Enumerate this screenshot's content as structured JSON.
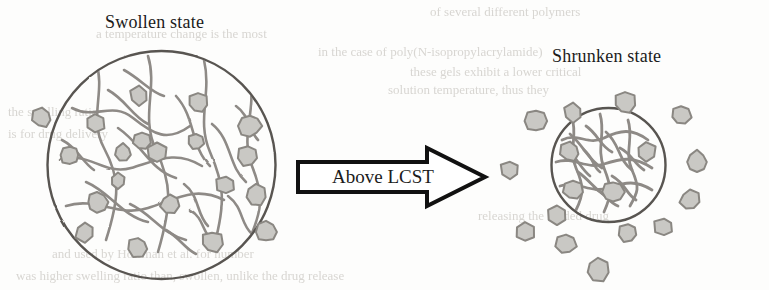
{
  "figure": {
    "title_left": "Swollen state",
    "title_right": "Shrunken state",
    "arrow_label": "Above LCST",
    "colors": {
      "background": "#fdfdfc",
      "circle_outline": "#595551",
      "polymer_strand": "#8e8a86",
      "particle_fill": "#c9c8c4",
      "particle_outline": "#8a8782",
      "text": "#1b1b1b",
      "arrow_outline": "#111111",
      "arrow_fill": "#ffffff",
      "ghost_text": "#d8d6d2"
    },
    "ghost_text_lines": [
      {
        "text": "of several different polymers",
        "x": 430,
        "y": 4,
        "size": 13
      },
      {
        "text": "a temperature change is the most",
        "x": 96,
        "y": 26,
        "size": 13
      },
      {
        "text": "in the case of poly(N-isopropylacrylamide)",
        "x": 318,
        "y": 44,
        "size": 13
      },
      {
        "text": "these gels exhibit a lower critical",
        "x": 410,
        "y": 64,
        "size": 13
      },
      {
        "text": "solution temperature, thus they",
        "x": 388,
        "y": 82,
        "size": 13
      },
      {
        "text": "the swelling ratio",
        "x": 8,
        "y": 104,
        "size": 13
      },
      {
        "text": "is for drug delivery",
        "x": 8,
        "y": 126,
        "size": 13
      },
      {
        "text": "releasing the loaded drug",
        "x": 478,
        "y": 208,
        "size": 13
      },
      {
        "text": "and used by Hoffman et al. for number",
        "x": 52,
        "y": 246,
        "size": 13
      },
      {
        "text": "was higher swelling ratio than, swollen, unlike the drug release",
        "x": 16,
        "y": 268,
        "size": 13
      }
    ],
    "left_particle": {
      "cx": 161.5,
      "cy": 165.0,
      "r": 114.0,
      "label": "swollen-hydrogel-particle",
      "description": "Large hand-drawn circle containing a loose polymer network and dispersed drug molecules"
    },
    "right_particle": {
      "cx": 608.5,
      "cy": 165.0,
      "r": 57.0,
      "label": "shrunken-hydrogel-particle",
      "description": "Small hand-drawn circle containing a dense collapsed polymer network"
    },
    "arrow": {
      "x": 298,
      "y": 148,
      "width": 187,
      "height": 58,
      "shaft_height": 30,
      "head_width": 58
    },
    "left_inner_particles": [
      {
        "x": 139,
        "y": 96,
        "r": 10,
        "s": 6
      },
      {
        "x": 198,
        "y": 103,
        "r": 10,
        "s": 7
      },
      {
        "x": 142,
        "y": 141,
        "r": 9,
        "s": 7
      },
      {
        "x": 95,
        "y": 123,
        "r": 10,
        "s": 6
      },
      {
        "x": 70,
        "y": 155,
        "r": 10,
        "s": 8
      },
      {
        "x": 123,
        "y": 153,
        "r": 9,
        "s": 7
      },
      {
        "x": 157,
        "y": 153,
        "r": 10,
        "s": 6
      },
      {
        "x": 196,
        "y": 142,
        "r": 8,
        "s": 7
      },
      {
        "x": 250,
        "y": 126,
        "r": 11,
        "s": 8
      },
      {
        "x": 248,
        "y": 156,
        "r": 11,
        "s": 7
      },
      {
        "x": 226,
        "y": 185,
        "r": 10,
        "s": 6
      },
      {
        "x": 256,
        "y": 195,
        "r": 10,
        "s": 7
      },
      {
        "x": 170,
        "y": 204,
        "r": 9,
        "s": 7
      },
      {
        "x": 97,
        "y": 202,
        "r": 10,
        "s": 8
      },
      {
        "x": 85,
        "y": 232,
        "r": 10,
        "s": 6
      },
      {
        "x": 138,
        "y": 247,
        "r": 10,
        "s": 7
      },
      {
        "x": 212,
        "y": 242,
        "r": 11,
        "s": 7
      },
      {
        "x": 266,
        "y": 232,
        "r": 10,
        "s": 8
      },
      {
        "x": 118,
        "y": 181,
        "r": 8,
        "s": 6
      }
    ],
    "left_outer_particles": [
      {
        "x": 42,
        "y": 118,
        "r": 10,
        "s": 7
      }
    ],
    "right_inner_particles": [
      {
        "x": 570,
        "y": 152,
        "r": 10,
        "s": 7
      },
      {
        "x": 646,
        "y": 152,
        "r": 10,
        "s": 6
      },
      {
        "x": 573,
        "y": 190,
        "r": 10,
        "s": 7
      },
      {
        "x": 613,
        "y": 192,
        "r": 11,
        "s": 8
      }
    ],
    "right_outer_particles": [
      {
        "x": 573,
        "y": 113,
        "r": 10,
        "s": 6
      },
      {
        "x": 625,
        "y": 103,
        "r": 11,
        "s": 7
      },
      {
        "x": 536,
        "y": 121,
        "r": 11,
        "s": 8
      },
      {
        "x": 681,
        "y": 115,
        "r": 10,
        "s": 7
      },
      {
        "x": 510,
        "y": 170,
        "r": 10,
        "s": 6
      },
      {
        "x": 697,
        "y": 162,
        "r": 11,
        "s": 8
      },
      {
        "x": 690,
        "y": 200,
        "r": 10,
        "s": 7
      },
      {
        "x": 525,
        "y": 232,
        "r": 10,
        "s": 6
      },
      {
        "x": 566,
        "y": 244,
        "r": 10,
        "s": 7
      },
      {
        "x": 628,
        "y": 233,
        "r": 10,
        "s": 7
      },
      {
        "x": 664,
        "y": 227,
        "r": 10,
        "s": 6
      },
      {
        "x": 598,
        "y": 270,
        "r": 11,
        "s": 7
      },
      {
        "x": 557,
        "y": 215,
        "r": 9,
        "s": 6
      }
    ],
    "left_network_strands": [
      "M 72 108 C 95 120, 112 101, 133 118 S 168 142, 190 126",
      "M 60 160 C 88 150, 104 176, 131 168 S 176 150, 202 166",
      "M 66 206 C 96 196, 118 218, 148 208 S 196 186, 224 200",
      "M 96 62 C 106 92, 88 118, 104 148 S 120 196, 106 240",
      "M 148 56 C 158 88, 140 116, 156 150 S 172 204, 158 252",
      "M 204 60 C 212 94, 196 120, 210 152 S 226 202, 214 246",
      "M 250 82 C 256 112, 240 136, 252 166 S 262 210, 250 238",
      "M 118 128 C 142 144, 150 170, 176 178",
      "M 176 96 C 196 118, 190 146, 210 166",
      "M 86 182 C 110 192, 122 216, 148 222",
      "M 212 124 C 232 140, 228 166, 246 182",
      "M 130 204 C 152 214, 162 234, 186 240",
      "M 228 196 C 244 208, 240 224, 252 234",
      "M 108 90 C 126 100, 132 116, 148 124",
      "M 184 184 C 200 196, 196 214, 208 226",
      "M 62 140 C 78 148, 82 162, 94 170",
      "M 236 106 C 250 116, 248 130, 258 140",
      "M 166 230 C 180 238, 184 248, 196 254",
      "M 124 70 C 142 80, 150 92, 164 96",
      "M 190 210 C 204 218, 202 232, 212 240"
    ],
    "right_network_strands": [
      "M 562 140 C 578 132, 588 146, 604 138 S 632 128, 648 140",
      "M 556 162 C 574 156, 586 170, 604 164 S 634 156, 652 168",
      "M 560 186 C 578 180, 590 194, 608 188 S 636 180, 652 190",
      "M 572 118 C 578 136, 568 150, 576 168 S 584 194, 576 210",
      "M 600 114 C 606 134, 596 148, 604 168 S 612 194, 604 212",
      "M 628 120 C 634 138, 624 152, 632 170 S 638 192, 630 206",
      "M 570 134 C 584 146, 588 160, 602 168",
      "M 606 132 C 620 144, 618 160, 632 170",
      "M 578 172 C 592 182, 596 192, 610 198",
      "M 612 176 C 626 184, 626 194, 636 200",
      "M 586 126 C 598 134, 600 146, 612 152",
      "M 566 150 C 578 158, 580 168, 590 176",
      "M 620 148 C 632 154, 634 164, 644 170",
      "M 594 188 C 606 194, 608 202, 618 206",
      "M 584 150 C 594 158, 592 166, 600 172"
    ]
  }
}
